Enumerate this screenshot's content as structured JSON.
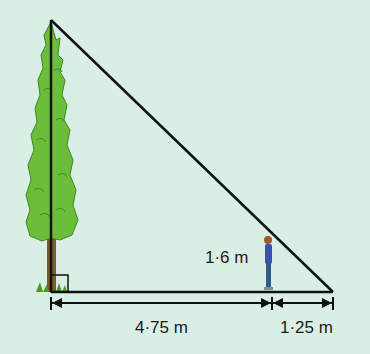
{
  "diagram": {
    "type": "similar-triangles-shadow",
    "labels": {
      "person_height": "1·6 m",
      "tree_to_person": "4·75 m",
      "person_to_shadow_tip": "1·25 m"
    },
    "colors": {
      "background": "#d9efe6",
      "lines": "#111111",
      "tree_foliage": "#6cbd3a",
      "tree_trunk": "#7a5a2e",
      "person_shirt": "#3a4fb0",
      "person_pants": "#2d5f86"
    }
  }
}
